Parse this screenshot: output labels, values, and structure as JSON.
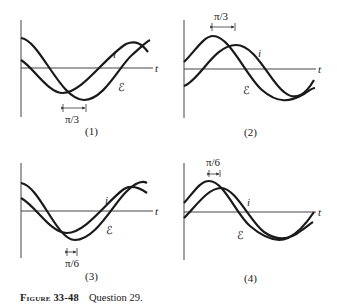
{
  "figure": {
    "caption_label": "Figure 33-48",
    "caption_text": "Question 29."
  },
  "panels": [
    {
      "number": "(1)",
      "axis_label": "t",
      "current_label": "i",
      "emf_label": "ℰ",
      "phase_label": "π/3",
      "description": "i leads ℰ by π/3 (ℰ minimum occurs later)"
    },
    {
      "number": "(2)",
      "axis_label": "t",
      "current_label": "i",
      "emf_label": "ℰ",
      "phase_label": "π/3",
      "description": "phase difference π/3 between peaks"
    },
    {
      "number": "(3)",
      "axis_label": "t",
      "current_label": "i",
      "emf_label": "ℰ",
      "phase_label": "π/6",
      "description": "phase difference π/6 between minima"
    },
    {
      "number": "(4)",
      "axis_label": "t",
      "current_label": "i",
      "emf_label": "ℰ",
      "phase_label": "π/6",
      "description": "phase difference π/6 between peaks"
    }
  ]
}
